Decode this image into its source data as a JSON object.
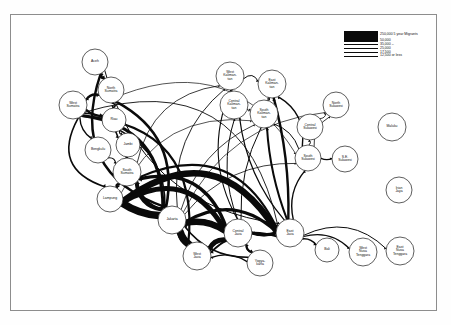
{
  "figure": {
    "type": "flow-map",
    "background_color": "#ffffff",
    "frame_color": "#8d8d8d",
    "edge_color": "#0a0a0a"
  },
  "legend": {
    "position": "top-right",
    "rows": [
      {
        "label": "250,000 5 year Migrants",
        "width_px": 7.5,
        "value": 250000
      },
      {
        "label": "50,000",
        "width_px": 2.4,
        "value": 50000
      },
      {
        "label": "35,000  –",
        "width_px": 1.7,
        "value": 35000
      },
      {
        "label": "25,000",
        "width_px": 1.2,
        "value": 25000
      },
      {
        "label": "17,500",
        "width_px": 0.8,
        "value": 17500
      },
      {
        "label": "12,500 or less",
        "width_px": 0.45,
        "value": 12500
      }
    ]
  },
  "chart_data": {
    "type": "network-diagram",
    "title": "",
    "nodes": [
      {
        "id": "aceh",
        "label": "Aceh",
        "x": 95,
        "y": 62,
        "r": 13
      },
      {
        "id": "nsumatra",
        "label": "North\nSumatra",
        "x": 111,
        "y": 90,
        "r": 13
      },
      {
        "id": "wsumatra",
        "label": "West\nSumatra",
        "x": 73,
        "y": 105,
        "r": 14
      },
      {
        "id": "riau",
        "label": "Riau",
        "x": 114,
        "y": 120,
        "r": 12
      },
      {
        "id": "jambi",
        "label": "Jambi",
        "x": 128,
        "y": 145,
        "r": 12
      },
      {
        "id": "bengkulu",
        "label": "Bengkulu",
        "x": 98,
        "y": 150,
        "r": 13
      },
      {
        "id": "ssumatra",
        "label": "South\nSumatra",
        "x": 127,
        "y": 172,
        "r": 14
      },
      {
        "id": "lampung",
        "label": "Lampung",
        "x": 110,
        "y": 199,
        "r": 13
      },
      {
        "id": "jakarta",
        "label": "Jakarta",
        "x": 172,
        "y": 220,
        "r": 14
      },
      {
        "id": "wjava",
        "label": "West\nJava",
        "x": 197,
        "y": 256,
        "r": 14
      },
      {
        "id": "cjava",
        "label": "Central\nJava",
        "x": 238,
        "y": 233,
        "r": 14
      },
      {
        "id": "yogya",
        "label": "Yogya-\nkarta",
        "x": 260,
        "y": 263,
        "r": 13
      },
      {
        "id": "ejava",
        "label": "East\nJava",
        "x": 290,
        "y": 233,
        "r": 14
      },
      {
        "id": "bali",
        "label": "Bali",
        "x": 327,
        "y": 250,
        "r": 12
      },
      {
        "id": "wnusa",
        "label": "West\nNusa\nTenggara",
        "x": 363,
        "y": 252,
        "r": 14
      },
      {
        "id": "enusa",
        "label": "East\nNusa\nTenggara",
        "x": 400,
        "y": 251,
        "r": 14
      },
      {
        "id": "wkali",
        "label": "West\nKaliman-\ntan",
        "x": 230,
        "y": 76,
        "r": 14
      },
      {
        "id": "ckali",
        "label": "Central\nKaliman-\ntan",
        "x": 234,
        "y": 105,
        "r": 14
      },
      {
        "id": "skali",
        "label": "South\nKaliman-\ntan",
        "x": 264,
        "y": 114,
        "r": 14
      },
      {
        "id": "ekali",
        "label": "East\nKaliman-\ntan",
        "x": 272,
        "y": 84,
        "r": 14
      },
      {
        "id": "csulawesi",
        "label": "Central\nSulawesi",
        "x": 310,
        "y": 127,
        "r": 13
      },
      {
        "id": "nsulawesi",
        "label": "North\nSulawesi",
        "x": 336,
        "y": 105,
        "r": 13
      },
      {
        "id": "ssulawesi",
        "label": "South\nSulawesi",
        "x": 308,
        "y": 158,
        "r": 13
      },
      {
        "id": "sesulawesi",
        "label": "S.E.\nSulawesi",
        "x": 345,
        "y": 159,
        "r": 13
      },
      {
        "id": "maluku",
        "label": "Maluku",
        "x": 392,
        "y": 127,
        "r": 14
      },
      {
        "id": "irian",
        "label": "Irian\nJaya",
        "x": 399,
        "y": 190,
        "r": 13
      }
    ],
    "edges": [
      {
        "from": "aceh",
        "to": "nsumatra",
        "w": 2.2,
        "curve": 0.1
      },
      {
        "from": "nsumatra",
        "to": "aceh",
        "w": 1.4,
        "curve": -0.16
      },
      {
        "from": "aceh",
        "to": "jakarta",
        "w": 2.4,
        "curve": 0.42
      },
      {
        "from": "aceh",
        "to": "ejava",
        "w": 1.0,
        "curve": 0.3
      },
      {
        "from": "nsumatra",
        "to": "wsumatra",
        "w": 1.8,
        "curve": 0.1
      },
      {
        "from": "wsumatra",
        "to": "nsumatra",
        "w": 2.0,
        "curve": -0.12
      },
      {
        "from": "wsumatra",
        "to": "riau",
        "w": 2.4,
        "curve": 0.08
      },
      {
        "from": "nsumatra",
        "to": "riau",
        "w": 1.6,
        "curve": -0.18
      },
      {
        "from": "wsumatra",
        "to": "bengkulu",
        "w": 1.4,
        "curve": 0.12
      },
      {
        "from": "wsumatra",
        "to": "jambi",
        "w": 1.6,
        "curve": -0.22
      },
      {
        "from": "riau",
        "to": "jambi",
        "w": 1.2,
        "curve": 0.1
      },
      {
        "from": "jambi",
        "to": "ssumatra",
        "w": 1.3,
        "curve": 0.12
      },
      {
        "from": "bengkulu",
        "to": "ssumatra",
        "w": 1.1,
        "curve": -0.12
      },
      {
        "from": "ssumatra",
        "to": "lampung",
        "w": 2.0,
        "curve": 0.1
      },
      {
        "from": "lampung",
        "to": "ssumatra",
        "w": 1.4,
        "curve": -0.14
      },
      {
        "from": "wsumatra",
        "to": "jakarta",
        "w": 3.0,
        "curve": -0.36
      },
      {
        "from": "wsumatra",
        "to": "lampung",
        "w": 1.6,
        "curve": 0.44
      },
      {
        "from": "wsumatra",
        "to": "wjava",
        "w": 2.2,
        "curve": -0.44
      },
      {
        "from": "nsumatra",
        "to": "jakarta",
        "w": 2.6,
        "curve": -0.3
      },
      {
        "from": "riau",
        "to": "jakarta",
        "w": 1.6,
        "curve": -0.24
      },
      {
        "from": "ssumatra",
        "to": "jakarta",
        "w": 2.2,
        "curve": 0.16
      },
      {
        "from": "lampung",
        "to": "jakarta",
        "w": 3.2,
        "curve": 0.1
      },
      {
        "from": "jakarta",
        "to": "lampung",
        "w": 7.5,
        "curve": -0.08
      },
      {
        "from": "jakarta",
        "to": "ssumatra",
        "w": 4.0,
        "curve": -0.22
      },
      {
        "from": "jakarta",
        "to": "wjava",
        "w": 7.5,
        "curve": 0.06
      },
      {
        "from": "wjava",
        "to": "jakarta",
        "w": 6.0,
        "curve": -0.1
      },
      {
        "from": "jakarta",
        "to": "cjava",
        "w": 4.0,
        "curve": -0.14
      },
      {
        "from": "cjava",
        "to": "jakarta",
        "w": 6.5,
        "curve": 0.12
      },
      {
        "from": "cjava",
        "to": "wjava",
        "w": 5.0,
        "curve": 0.14
      },
      {
        "from": "wjava",
        "to": "cjava",
        "w": 2.6,
        "curve": -0.12
      },
      {
        "from": "cjava",
        "to": "ejava",
        "w": 3.0,
        "curve": 0.07
      },
      {
        "from": "ejava",
        "to": "cjava",
        "w": 2.2,
        "curve": -0.09
      },
      {
        "from": "cjava",
        "to": "yogya",
        "w": 2.0,
        "curve": 0.1
      },
      {
        "from": "yogya",
        "to": "cjava",
        "w": 1.6,
        "curve": -0.12
      },
      {
        "from": "yogya",
        "to": "wjava",
        "w": 1.4,
        "curve": 0.14
      },
      {
        "from": "yogya",
        "to": "jakarta",
        "w": 1.6,
        "curve": -0.18
      },
      {
        "from": "ejava",
        "to": "jakarta",
        "w": 3.0,
        "curve": 0.28
      },
      {
        "from": "ejava",
        "to": "wjava",
        "w": 2.0,
        "curve": 0.22
      },
      {
        "from": "ejava",
        "to": "lampung",
        "w": 6.5,
        "curve": 0.46
      },
      {
        "from": "cjava",
        "to": "lampung",
        "w": 5.0,
        "curve": 0.4
      },
      {
        "from": "cjava",
        "to": "ssumatra",
        "w": 3.4,
        "curve": 0.34
      },
      {
        "from": "ejava",
        "to": "ssumatra",
        "w": 2.0,
        "curve": 0.4
      },
      {
        "from": "ejava",
        "to": "bali",
        "w": 1.6,
        "curve": -0.1
      },
      {
        "from": "ejava",
        "to": "wnusa",
        "w": 1.2,
        "curve": -0.18
      },
      {
        "from": "ejava",
        "to": "enusa",
        "w": 1.0,
        "curve": -0.26
      },
      {
        "from": "ejava",
        "to": "ekali",
        "w": 2.4,
        "curve": 0.06
      },
      {
        "from": "ejava",
        "to": "skali",
        "w": 2.0,
        "curve": -0.06
      },
      {
        "from": "ejava",
        "to": "ckali",
        "w": 1.2,
        "curve": -0.12
      },
      {
        "from": "ejava",
        "to": "ssulawesi",
        "w": 1.4,
        "curve": -0.16
      },
      {
        "from": "cjava",
        "to": "wkali",
        "w": 1.1,
        "curve": -0.2
      },
      {
        "from": "cjava",
        "to": "ckali",
        "w": 1.0,
        "curve": -0.14
      },
      {
        "from": "cjava",
        "to": "skali",
        "w": 1.0,
        "curve": -0.1
      },
      {
        "from": "jakarta",
        "to": "wkali",
        "w": 0.9,
        "curve": -0.22
      },
      {
        "from": "jakarta",
        "to": "skali",
        "w": 0.8,
        "curve": -0.18
      },
      {
        "from": "jakarta",
        "to": "nsulawesi",
        "w": 0.7,
        "curve": -0.24
      },
      {
        "from": "jakarta",
        "to": "ssulawesi",
        "w": 0.8,
        "curve": -0.2
      },
      {
        "from": "wkali",
        "to": "ckali",
        "w": 0.9,
        "curve": 0.12
      },
      {
        "from": "ckali",
        "to": "skali",
        "w": 1.0,
        "curve": 0.1
      },
      {
        "from": "skali",
        "to": "ekali",
        "w": 1.2,
        "curve": 0.1
      },
      {
        "from": "wkali",
        "to": "ekali",
        "w": 1.0,
        "curve": -0.22
      },
      {
        "from": "ssulawesi",
        "to": "ekali",
        "w": 1.4,
        "curve": 0.22
      },
      {
        "from": "ssulawesi",
        "to": "skali",
        "w": 1.0,
        "curve": 0.14
      },
      {
        "from": "ssulawesi",
        "to": "csulawesi",
        "w": 1.0,
        "curve": 0.1
      },
      {
        "from": "csulawesi",
        "to": "nsulawesi",
        "w": 0.8,
        "curve": 0.1
      },
      {
        "from": "ssulawesi",
        "to": "sesulawesi",
        "w": 1.2,
        "curve": 0.06
      },
      {
        "from": "ssulawesi",
        "to": "nsulawesi",
        "w": 0.8,
        "curve": -0.18
      },
      {
        "from": "ssumatra",
        "to": "wkali",
        "w": 0.8,
        "curve": -0.28
      },
      {
        "from": "lampung",
        "to": "skali",
        "w": 0.7,
        "curve": -0.3
      },
      {
        "from": "nsumatra",
        "to": "ssulawesi",
        "w": 0.7,
        "curve": -0.36
      },
      {
        "from": "wsumatra",
        "to": "ejava",
        "w": 0.9,
        "curve": -0.48
      }
    ]
  }
}
